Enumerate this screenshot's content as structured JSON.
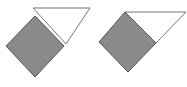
{
  "figures": [
    {
      "id": "left",
      "square": {
        "points": "35,16 64,46 35,77 6,46"
      },
      "triangle": {
        "points": "33,8 90,8 66,44"
      }
    },
    {
      "id": "right",
      "square": {
        "points": "125,12 156,43 128,72 99,42"
      },
      "triangle": {
        "points": "125,12 186,12 156,43"
      }
    }
  ],
  "colors": {
    "square_fill": "#8a8a8a",
    "square_stroke": "#555555",
    "triangle_fill": "#ffffff",
    "triangle_stroke": "#777777"
  }
}
